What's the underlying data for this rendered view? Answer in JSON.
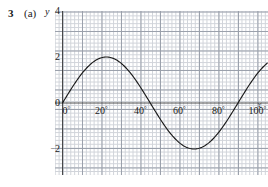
{
  "question": {
    "number": "3",
    "part": "(a)"
  },
  "axes": {
    "y_name": "y",
    "x_name": "x",
    "y_ticks": [
      {
        "label": "4",
        "value": 4,
        "negative": false
      },
      {
        "label": "2",
        "value": 2,
        "negative": false
      },
      {
        "label": "0",
        "value": 0,
        "negative": false
      },
      {
        "label": "2",
        "value": -2,
        "negative": true
      },
      {
        "label": "4",
        "value": -4,
        "negative": true
      }
    ],
    "x_ticks": [
      {
        "label": "0",
        "value": 0,
        "degree_symbol": "°"
      },
      {
        "label": "20",
        "value": 20,
        "degree_symbol": "°"
      },
      {
        "label": "40",
        "value": 40,
        "degree_symbol": "°"
      },
      {
        "label": "60",
        "value": 60,
        "degree_symbol": "°"
      },
      {
        "label": "80",
        "value": 80,
        "degree_symbol": "°"
      },
      {
        "label": "100",
        "value": 100,
        "degree_symbol": "°"
      }
    ]
  },
  "chart_data": {
    "type": "line",
    "title": "",
    "subtitle": "",
    "xlabel": "x",
    "ylabel": "y",
    "xlim": [
      -3,
      106
    ],
    "ylim": [
      -4.6,
      4.6
    ],
    "grid": true,
    "grid_minor_step_x": 2,
    "grid_minor_step_y": 0.1714,
    "grid_major_step_x": 10,
    "grid_major_step_y": 0.857,
    "legend": "none",
    "annotations": [],
    "series": [
      {
        "name": "y = 2 sin(4x)",
        "color": "#1a1a1a",
        "amplitude": 2,
        "period_degrees": 90,
        "phase_degrees": 0,
        "x": [
          0,
          5,
          10,
          15,
          20,
          22.5,
          25,
          30,
          35,
          40,
          45,
          50,
          55,
          60,
          65,
          67.5,
          70,
          75,
          80,
          85,
          90,
          95,
          100
        ],
        "values": [
          0,
          0.68,
          1.29,
          1.73,
          1.97,
          2.0,
          1.97,
          1.73,
          1.29,
          0.68,
          0,
          -0.68,
          -1.29,
          -1.73,
          -1.97,
          -2.0,
          -1.97,
          -1.73,
          -1.29,
          -0.68,
          0,
          0.68,
          1.29
        ]
      }
    ]
  },
  "colors": {
    "curve": "#1a1a1a",
    "axis": "#3a3a3a",
    "grid_minor": "#c9cdd4",
    "grid_major": "#9aa0ab",
    "text": "#1a1a1a",
    "background": "#ffffff"
  }
}
